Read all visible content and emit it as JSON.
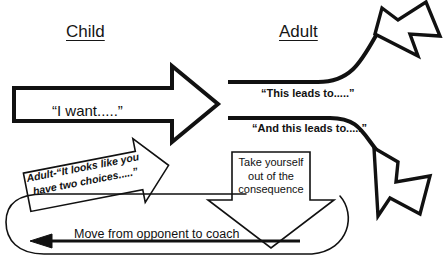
{
  "diagram": {
    "columns": {
      "child_header": "Child",
      "adult_header": "Adult"
    },
    "child_demand": {
      "label": "“I want.....”",
      "shape": "right-block-arrow"
    },
    "adult_responses": [
      {
        "label": "“This leads to.....”",
        "shape": "curved-arrow-up-right"
      },
      {
        "label": "“And this leads to.....”",
        "shape": "curved-arrow-down-right"
      }
    ],
    "adult_choices": {
      "label": "Adult-“It looks like you have two choices.....”",
      "shape": "tilted-block-arrow-up-right"
    },
    "consequence_box": {
      "line1": "Take yourself",
      "line2": "out of the",
      "line3": "consequence",
      "shape": "down-block-arrow"
    },
    "feedback_loop": {
      "label": "Move from opponent to coach",
      "shape": "left-arrow-loop"
    },
    "colors": {
      "stroke": "#111111",
      "text": "#111111",
      "background": "#ffffff"
    }
  }
}
